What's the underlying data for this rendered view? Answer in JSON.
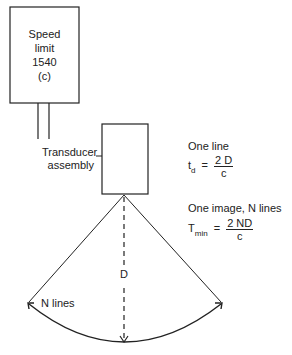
{
  "speed_box": {
    "lines": [
      "Speed",
      "limit",
      "1540",
      "(c)"
    ]
  },
  "transducer_label": {
    "line1": "Transducer",
    "line2": "assembly"
  },
  "one_line": {
    "title": "One line",
    "lhs_main": "t",
    "lhs_sub": "d",
    "equals": "=",
    "numerator": "2 D",
    "denominator": "c"
  },
  "one_image": {
    "title": "One image, N lines",
    "lhs_main": "T",
    "lhs_sub": "min",
    "equals": "=",
    "numerator": "2 ND",
    "denominator": "c"
  },
  "depth_label": "D",
  "arc_label": "N lines",
  "colors": {
    "stroke": "#222222",
    "background": "#ffffff"
  }
}
